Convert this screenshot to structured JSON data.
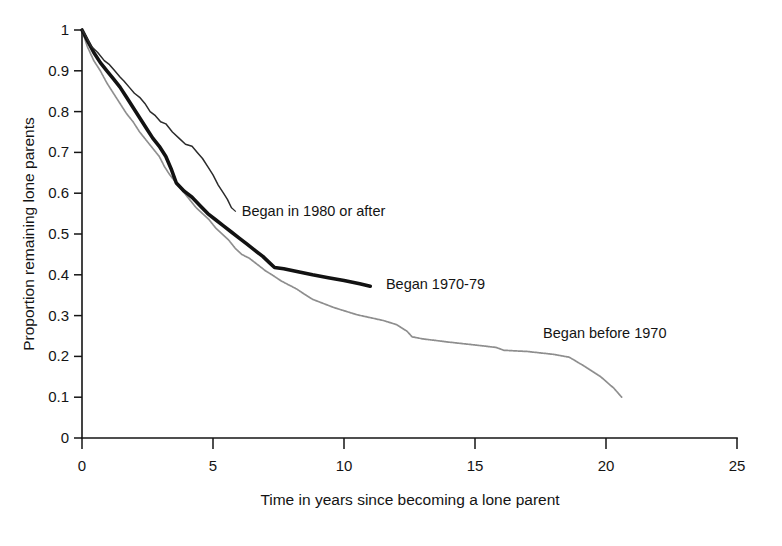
{
  "chart_data": {
    "type": "line",
    "title": "",
    "subtitle": "",
    "xlabel": "Time in years since becoming  a lone parent",
    "ylabel": "Proportion remaining lone parents",
    "xlim": [
      0,
      25
    ],
    "ylim": [
      0,
      1
    ],
    "grid": false,
    "legend_position": "inline-annotations",
    "xticks": [
      0,
      5,
      10,
      15,
      20,
      25
    ],
    "xtick_labels": [
      "0",
      "5",
      "10",
      "15",
      "20",
      "25"
    ],
    "yticks": [
      0,
      0.1,
      0.2,
      0.3,
      0.4,
      0.5,
      0.6,
      0.7,
      0.8,
      0.9,
      1
    ],
    "ytick_labels": [
      "0",
      "0.1",
      "0.2",
      "0.3",
      "0.4",
      "0.5",
      "0.6",
      "0.7",
      "0.8",
      "0.9",
      "1"
    ],
    "series": [
      {
        "name": "Began in 1980 or after",
        "style": "thin-solid",
        "color": "#2b2b2b",
        "label_position": {
          "x": 6.1,
          "y": 0.545
        },
        "x": [
          0.0,
          0.15,
          0.35,
          0.6,
          0.85,
          1.05,
          1.25,
          1.45,
          1.6,
          1.8,
          2.0,
          2.2,
          2.4,
          2.6,
          2.8,
          3.0,
          3.2,
          3.45,
          3.7,
          3.95,
          4.2,
          4.4,
          4.6,
          4.8,
          5.0,
          5.2,
          5.4,
          5.55,
          5.7
        ],
        "y": [
          1.0,
          0.985,
          0.96,
          0.945,
          0.925,
          0.915,
          0.9,
          0.885,
          0.875,
          0.86,
          0.845,
          0.835,
          0.82,
          0.8,
          0.79,
          0.775,
          0.77,
          0.75,
          0.735,
          0.72,
          0.715,
          0.7,
          0.685,
          0.665,
          0.645,
          0.62,
          0.6,
          0.585,
          0.565
        ]
      },
      {
        "name": "Began 1970-79",
        "style": "thick-solid",
        "color": "#121212",
        "label_position": {
          "x": 11.6,
          "y": 0.365
        },
        "x": [
          0.0,
          0.2,
          0.45,
          0.7,
          0.95,
          1.2,
          1.45,
          1.7,
          1.95,
          2.2,
          2.45,
          2.7,
          2.95,
          3.2,
          3.4,
          3.6,
          3.9,
          4.2,
          4.5,
          4.8,
          5.1,
          5.4,
          5.7,
          6.0,
          6.3,
          6.6,
          6.9,
          7.15,
          7.35,
          7.7,
          8.2,
          8.8,
          9.4,
          10.0,
          10.6,
          11.0
        ],
        "y": [
          1.0,
          0.975,
          0.945,
          0.92,
          0.9,
          0.88,
          0.86,
          0.835,
          0.81,
          0.785,
          0.76,
          0.735,
          0.715,
          0.69,
          0.66,
          0.625,
          0.605,
          0.59,
          0.57,
          0.55,
          0.535,
          0.52,
          0.505,
          0.49,
          0.475,
          0.46,
          0.445,
          0.43,
          0.418,
          0.415,
          0.408,
          0.4,
          0.393,
          0.386,
          0.378,
          0.372
        ]
      },
      {
        "name": "Began before 1970",
        "style": "dotted",
        "color": "#8e8e8e",
        "label_position": {
          "x": 17.6,
          "y": 0.245
        },
        "x": [
          0.0,
          0.2,
          0.45,
          0.7,
          0.95,
          1.2,
          1.45,
          1.7,
          1.95,
          2.2,
          2.45,
          2.7,
          2.95,
          3.15,
          3.35,
          3.6,
          3.85,
          4.1,
          4.35,
          4.6,
          4.85,
          5.1,
          5.35,
          5.6,
          5.85,
          6.1,
          6.4,
          6.7,
          7.0,
          7.3,
          7.6,
          7.9,
          8.2,
          8.5,
          8.8,
          9.2,
          9.6,
          10.0,
          10.5,
          11.0,
          11.5,
          12.0,
          12.4,
          12.6,
          13.0,
          14.0,
          15.0,
          15.8,
          16.1,
          17.0,
          18.0,
          18.6,
          19.2,
          19.8,
          20.3,
          20.6
        ],
        "y": [
          1.0,
          0.96,
          0.925,
          0.9,
          0.87,
          0.845,
          0.82,
          0.795,
          0.775,
          0.75,
          0.73,
          0.71,
          0.69,
          0.665,
          0.645,
          0.625,
          0.605,
          0.585,
          0.565,
          0.55,
          0.535,
          0.515,
          0.5,
          0.485,
          0.465,
          0.45,
          0.44,
          0.425,
          0.41,
          0.398,
          0.385,
          0.375,
          0.365,
          0.352,
          0.34,
          0.33,
          0.32,
          0.312,
          0.302,
          0.295,
          0.288,
          0.278,
          0.262,
          0.248,
          0.243,
          0.235,
          0.228,
          0.222,
          0.215,
          0.212,
          0.205,
          0.198,
          0.175,
          0.15,
          0.122,
          0.1
        ]
      }
    ]
  },
  "axes": {
    "y_title": "Proportion remaining lone parents",
    "x_title": "Time in years since becoming  a lone parent",
    "x_tick_labels": [
      "0",
      "5",
      "10",
      "15",
      "20",
      "25"
    ],
    "y_tick_labels": [
      "0",
      "0.1",
      "0.2",
      "0.3",
      "0.4",
      "0.5",
      "0.6",
      "0.7",
      "0.8",
      "0.9",
      "1"
    ]
  },
  "annotations": {
    "series_1980": "Began in 1980 or after",
    "series_1970s": "Began 1970-79",
    "series_pre1970": "Began before 1970"
  },
  "colors": {
    "background": "#ffffff",
    "axis": "#151515",
    "curve_thin": "#2b2b2b",
    "curve_thick": "#121212",
    "curve_dotted": "#8e8e8e",
    "text": "#141414"
  }
}
